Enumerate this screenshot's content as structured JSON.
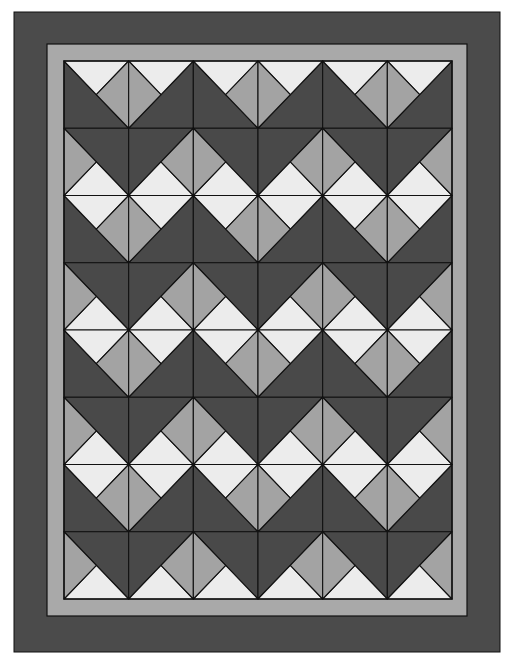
{
  "colors": {
    "background": "#ffffff",
    "outer_border": "#4b4b4b",
    "inner_border": "#a9a9a9",
    "dark": "#494949",
    "medium": "#a3a3a3",
    "light": "#ececec",
    "line": "#111111"
  },
  "layout": {
    "outer_border": {
      "x": 14,
      "y": 12,
      "w": 486,
      "h": 640
    },
    "inner_border": {
      "x": 47,
      "y": 44,
      "w": 420,
      "h": 572
    },
    "block_area": {
      "x": 64,
      "y": 61,
      "w": 388,
      "h": 538
    },
    "columns": 6,
    "rows": 8
  },
  "row_patterns": [
    [
      "A",
      "B",
      "A",
      "B",
      "A",
      "B"
    ],
    [
      "C",
      "D",
      "C",
      "D",
      "C",
      "D"
    ],
    [
      "A",
      "B",
      "A",
      "B",
      "A",
      "B"
    ],
    [
      "C",
      "D",
      "C",
      "D",
      "C",
      "D"
    ],
    [
      "A",
      "B",
      "A",
      "B",
      "A",
      "B"
    ],
    [
      "C",
      "D",
      "C",
      "D",
      "C",
      "D"
    ],
    [
      "A",
      "B",
      "A",
      "B",
      "A",
      "B"
    ],
    [
      "C",
      "D",
      "C",
      "D",
      "C",
      "D"
    ]
  ],
  "cell_types": {
    "A": {
      "dark": [
        "TL",
        "BL",
        "BR"
      ],
      "light": [
        "TL",
        "TR",
        "C"
      ],
      "medium": [
        "TR",
        "BR",
        "C"
      ]
    },
    "B": {
      "dark": [
        "TR",
        "BR",
        "BL"
      ],
      "light": [
        "TL",
        "TR",
        "C"
      ],
      "medium": [
        "TL",
        "BL",
        "C"
      ]
    },
    "C": {
      "dark": [
        "TL",
        "TR",
        "BR"
      ],
      "light": [
        "BL",
        "BR",
        "C"
      ],
      "medium": [
        "TL",
        "BL",
        "C"
      ]
    },
    "D": {
      "dark": [
        "TL",
        "TR",
        "BL"
      ],
      "light": [
        "BL",
        "BR",
        "C"
      ],
      "medium": [
        "TR",
        "BR",
        "C"
      ]
    }
  }
}
